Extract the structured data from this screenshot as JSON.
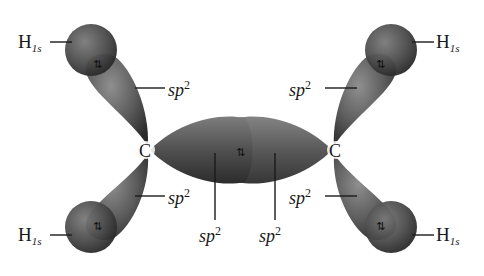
{
  "diagram": {
    "colors": {
      "lobe_light": "#8a8a8a",
      "lobe_mid": "#5a5a5a",
      "lobe_dark": "#2e2e2e",
      "label": "#1a1a1a",
      "background": "#ffffff"
    },
    "atoms": {
      "carbon_left": "C",
      "carbon_right": "C"
    },
    "labels": {
      "h_top_left": {
        "base": "H",
        "sub": "1s"
      },
      "h_top_right": {
        "base": "H",
        "sub": "1s"
      },
      "h_bottom_left": {
        "base": "H",
        "sub": "1s"
      },
      "h_bottom_right": {
        "base": "H",
        "sub": "1s"
      },
      "sp2_top_left": {
        "base": "sp",
        "sup": "2"
      },
      "sp2_top_right": {
        "base": "sp",
        "sup": "2"
      },
      "sp2_bottom_left": {
        "base": "sp",
        "sup": "2"
      },
      "sp2_bottom_right": {
        "base": "sp",
        "sup": "2"
      },
      "sp2_center_left": {
        "base": "sp",
        "sup": "2"
      },
      "sp2_center_right": {
        "base": "sp",
        "sup": "2"
      }
    },
    "electron_pair_symbol": "⇅"
  }
}
